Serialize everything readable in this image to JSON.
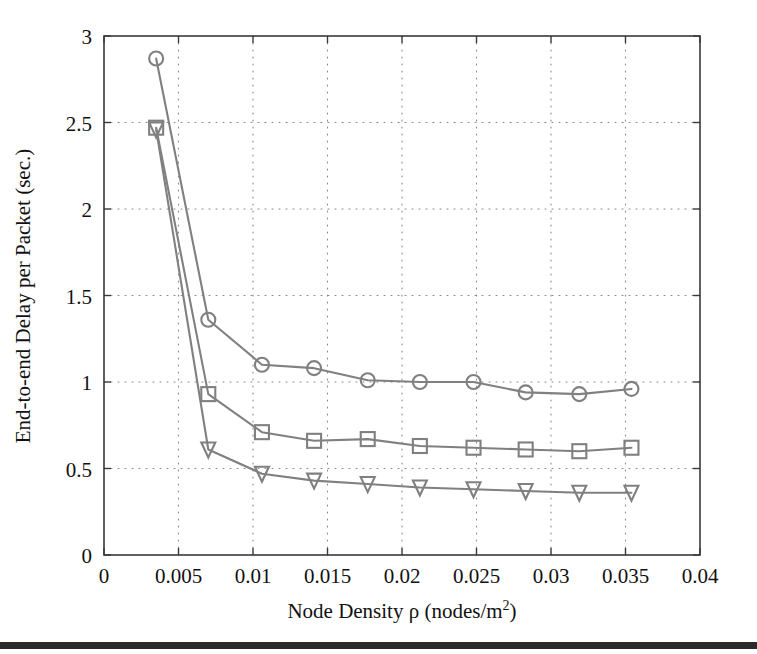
{
  "figure": {
    "background_color": "#ffffff",
    "series_color": "#808080",
    "axis_color": "#3a3a3a",
    "grid_color": "#8a8a8a",
    "bottom_rule_color": "#2b2b2b"
  },
  "axes": {
    "x_title": "Node Density ρ (nodes/m²)",
    "x_title_parts": {
      "prefix": "Node Density ρ (nodes/m",
      "superscript": "2",
      "suffix": ")"
    },
    "y_title": "End-to-end Delay per Packet (sec.)",
    "x_ticks": [
      "0",
      "0.005",
      "0.01",
      "0.015",
      "0.02",
      "0.025",
      "0.03",
      "0.035",
      "0.04"
    ],
    "y_ticks": [
      "0",
      "0.5",
      "1",
      "1.5",
      "2",
      "2.5",
      "3"
    ]
  },
  "chart_data": {
    "type": "line",
    "title": "",
    "xlabel": "Node Density ρ (nodes/m^2)",
    "ylabel": "End-to-end Delay per Packet (sec.)",
    "xlim": [
      0,
      0.04
    ],
    "ylim": [
      0,
      3
    ],
    "xticks": [
      0,
      0.005,
      0.01,
      0.015,
      0.02,
      0.025,
      0.03,
      0.035,
      0.04
    ],
    "yticks": [
      0,
      0.5,
      1,
      1.5,
      2,
      2.5,
      3
    ],
    "grid": true,
    "grid_style": "dotted",
    "legend": false,
    "legend_position": "none",
    "x": [
      0.0035,
      0.007,
      0.0106,
      0.0141,
      0.0177,
      0.0212,
      0.0248,
      0.0283,
      0.0319,
      0.0354
    ],
    "series": [
      {
        "name": "series-circle",
        "marker": "circle",
        "color": "#808080",
        "values": [
          2.87,
          1.36,
          1.1,
          1.08,
          1.01,
          1.0,
          1.0,
          0.94,
          0.93,
          0.96
        ]
      },
      {
        "name": "series-square",
        "marker": "square",
        "color": "#808080",
        "values": [
          2.47,
          0.93,
          0.71,
          0.66,
          0.67,
          0.63,
          0.62,
          0.61,
          0.6,
          0.62
        ]
      },
      {
        "name": "series-triangle-down",
        "marker": "triangle-down",
        "color": "#808080",
        "values": [
          2.46,
          0.61,
          0.47,
          0.43,
          0.41,
          0.39,
          0.38,
          0.37,
          0.36,
          0.36
        ]
      }
    ]
  }
}
